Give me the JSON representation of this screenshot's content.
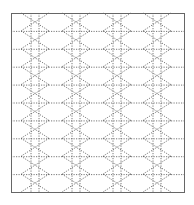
{
  "diagram": {
    "type": "tiled-lattice-pattern",
    "frame": {
      "x": 11,
      "y": 13,
      "width": 173,
      "height": 179,
      "stroke": "#666666"
    },
    "rows": 10,
    "columns": [
      35,
      76,
      117,
      157
    ],
    "column_half_width": 14,
    "center_line_offset": 4,
    "line_color": "#555555",
    "dash": "1.2 1.3"
  }
}
